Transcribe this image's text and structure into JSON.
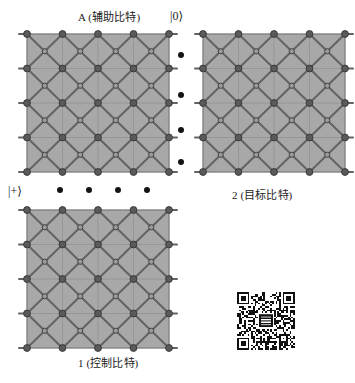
{
  "figure": {
    "width": 355,
    "height": 383,
    "background": "#ffffff"
  },
  "labels": {
    "ancilla": {
      "symbol": "A",
      "text": " (辅助比特)",
      "full": "A (辅助比特)",
      "x": 78,
      "y": 12
    },
    "target": {
      "full": "2 (目标比特)",
      "x": 232,
      "y": 190
    },
    "control": {
      "full": "1 (控制比特)",
      "x": 78,
      "y": 358
    }
  },
  "kets": {
    "zero": {
      "text": "|0⟩",
      "x": 170,
      "y": 10
    },
    "plus": {
      "text": "|+⟩",
      "x": 8,
      "y": 185
    }
  },
  "ellipsis": {
    "vertical": {
      "x": 181,
      "ys": [
        55,
        95,
        130,
        162
      ],
      "count": 4,
      "color": "#141414",
      "size": 6
    },
    "horizontal": {
      "y": 190,
      "xs": [
        60,
        89,
        118,
        147
      ],
      "count": 4,
      "color": "#141414",
      "size": 6
    }
  },
  "lattices": [
    {
      "name": "ancilla-lattice",
      "role": "A (辅助比特)",
      "x": 27,
      "y": 34,
      "width": 142,
      "height": 138,
      "cols": 4,
      "rows": 4,
      "stub_sides": [
        "left",
        "right"
      ]
    },
    {
      "name": "target-lattice",
      "role": "2 (目标比特)",
      "x": 203,
      "y": 34,
      "width": 142,
      "height": 138,
      "cols": 4,
      "rows": 4,
      "stub_sides": [
        "left",
        "right"
      ]
    },
    {
      "name": "control-lattice",
      "role": "1 (控制比特)",
      "x": 27,
      "y": 210,
      "width": 142,
      "height": 138,
      "cols": 4,
      "rows": 4,
      "stub_sides": [
        "left",
        "right"
      ]
    }
  ],
  "lattice_style": {
    "face_fill": "#a8a8a8",
    "grid_line": "#8f8f8f",
    "bond_line": "#636363",
    "border_line": "#7a7a7a",
    "node_fill": "#5a5a5a",
    "node_edge": "#3a3a3a",
    "center_node_fill": "#9a9a9a",
    "node_radius": 3.4,
    "center_node_radius": 2.6,
    "bond_width": 2.0,
    "grid_width": 0.7
  },
  "qr_code": {
    "name": "qr-code",
    "x": 237,
    "y": 292,
    "size": 58,
    "modules": 33,
    "dark": "#111111",
    "light": "#ffffff",
    "has_center_logo": true
  }
}
